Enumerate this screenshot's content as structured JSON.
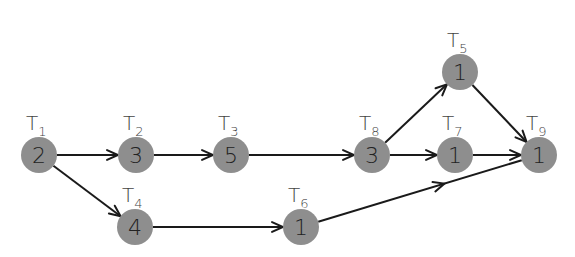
{
  "diagram": {
    "type": "task-dependency-graph",
    "nodes": [
      {
        "id": "T1",
        "label": "T",
        "sub": "1",
        "value": "2",
        "x": 39,
        "y": 155
      },
      {
        "id": "T2",
        "label": "T",
        "sub": "2",
        "value": "3",
        "x": 136,
        "y": 155
      },
      {
        "id": "T3",
        "label": "T",
        "sub": "3",
        "value": "5",
        "x": 231,
        "y": 155
      },
      {
        "id": "T4",
        "label": "T",
        "sub": "4",
        "value": "4",
        "x": 135,
        "y": 227
      },
      {
        "id": "T5",
        "label": "T",
        "sub": "5",
        "value": "1",
        "x": 460,
        "y": 72
      },
      {
        "id": "T6",
        "label": "T",
        "sub": "6",
        "value": "1",
        "x": 301,
        "y": 227
      },
      {
        "id": "T7",
        "label": "T",
        "sub": "7",
        "value": "1",
        "x": 455,
        "y": 155
      },
      {
        "id": "T8",
        "label": "T",
        "sub": "8",
        "value": "3",
        "x": 372,
        "y": 155
      },
      {
        "id": "T9",
        "label": "T",
        "sub": "9",
        "value": "1",
        "x": 539,
        "y": 155
      }
    ],
    "edges": [
      {
        "from": "T1",
        "to": "T2"
      },
      {
        "from": "T1",
        "to": "T4"
      },
      {
        "from": "T2",
        "to": "T3"
      },
      {
        "from": "T3",
        "to": "T8"
      },
      {
        "from": "T4",
        "to": "T6"
      },
      {
        "from": "T8",
        "to": "T5"
      },
      {
        "from": "T8",
        "to": "T7"
      },
      {
        "from": "T5",
        "to": "T9"
      },
      {
        "from": "T7",
        "to": "T9"
      },
      {
        "from": "T6",
        "to": "T9",
        "arrow_midpoint": true
      }
    ],
    "colors": {
      "node_fill": "#8e8e8e",
      "edge": "#1a1a1a",
      "text": "#222222"
    }
  }
}
